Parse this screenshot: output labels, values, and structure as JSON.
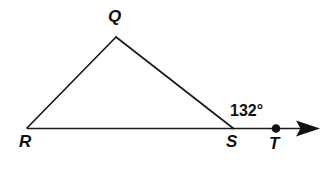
{
  "figure": {
    "kind": "geometry-diagram",
    "background_color": "#ffffff",
    "stroke_color": "#1a1a1a",
    "label_color": "#111111",
    "stroke_width": 1.6
  },
  "points": {
    "Q": {
      "label": "Q",
      "x": 116,
      "y": 37
    },
    "R": {
      "label": "R",
      "x": 27,
      "y": 128
    },
    "S": {
      "label": "S",
      "x": 233,
      "y": 128
    },
    "T": {
      "label": "T",
      "x": 276,
      "y": 128,
      "marker": "filled-dot",
      "marker_radius": 4.2
    }
  },
  "segments": [
    {
      "name": "RQ",
      "from": "R",
      "to": "Q"
    },
    {
      "name": "QS",
      "from": "Q",
      "to": "S"
    },
    {
      "name": "RT",
      "from": "R",
      "to": "arrow-tip"
    }
  ],
  "ray": {
    "name": "ray-RT",
    "from_x": 27,
    "to_x": 320,
    "y": 128,
    "arrowhead": "solid-triangle"
  },
  "angles": [
    {
      "name": "exterior-angle-at-S",
      "value": "132°",
      "vertex": "S",
      "position": {
        "x": 230,
        "y": 103
      }
    }
  ]
}
